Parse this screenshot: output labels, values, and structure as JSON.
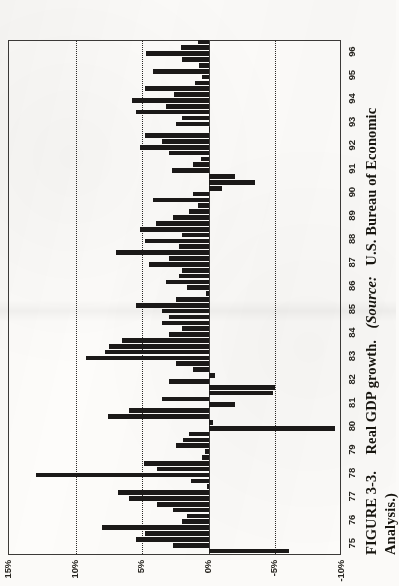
{
  "figure": {
    "caption_label": "FIGURE 3-3.",
    "caption_title": "Real GDP growth.",
    "caption_source_open": "(Source:",
    "caption_source": "U.S. Bureau of Economic",
    "caption_source_cont": "Analysis.)",
    "orientation": "page rotated 90 degrees (landscape figure on portrait scan)"
  },
  "colors": {
    "bar": "#1b1918",
    "frame": "#3c3a38",
    "grid": "#2d2b29",
    "paper": "#fbfaf8"
  },
  "chart_data": {
    "type": "bar",
    "title": "Real GDP growth",
    "xlabel": "",
    "ylabel": "",
    "orientation": "vertical-bars-in-printed-figure",
    "grid": true,
    "legend": false,
    "ylim": [
      -10,
      15
    ],
    "yticks": [
      15,
      10,
      5,
      0,
      -5,
      -10
    ],
    "ytick_labels": [
      "15%",
      "10%",
      "5%",
      "0%",
      "-5%",
      "-10%"
    ],
    "gridline_values": [
      10,
      5,
      -5
    ],
    "zero_line_value": 0,
    "categories": [
      "75",
      "76",
      "77",
      "78",
      "79",
      "80",
      "81",
      "82",
      "83",
      "84",
      "85",
      "86",
      "87",
      "88",
      "89",
      "90",
      "91",
      "92",
      "93",
      "94",
      "95",
      "96"
    ],
    "xtick_labels": [
      "75",
      "76",
      "77",
      "78",
      "79",
      "80",
      "81",
      "82",
      "83",
      "84",
      "85",
      "86",
      "87",
      "88",
      "89",
      "90",
      "91",
      "92",
      "93",
      "94",
      "95",
      "96"
    ],
    "frequency": "quarterly",
    "series": [
      {
        "name": "Real GDP growth (quarterly, annualized %)",
        "points": [
          {
            "period": "75Q1",
            "value": -6.0
          },
          {
            "period": "75Q2",
            "value": 2.7
          },
          {
            "period": "75Q3",
            "value": 5.5
          },
          {
            "period": "75Q4",
            "value": 4.8
          },
          {
            "period": "76Q1",
            "value": 8.0
          },
          {
            "period": "76Q2",
            "value": 2.0
          },
          {
            "period": "76Q3",
            "value": 1.6
          },
          {
            "period": "76Q4",
            "value": 2.7
          },
          {
            "period": "77Q1",
            "value": 3.9
          },
          {
            "period": "77Q2",
            "value": 6.0
          },
          {
            "period": "77Q3",
            "value": 6.8
          },
          {
            "period": "77Q4",
            "value": 0.1
          },
          {
            "period": "78Q1",
            "value": 1.3
          },
          {
            "period": "78Q2",
            "value": 13.0
          },
          {
            "period": "78Q3",
            "value": 3.9
          },
          {
            "period": "78Q4",
            "value": 4.9
          },
          {
            "period": "79Q1",
            "value": 0.5
          },
          {
            "period": "79Q2",
            "value": 0.3
          },
          {
            "period": "79Q3",
            "value": 2.5
          },
          {
            "period": "79Q4",
            "value": 1.9
          },
          {
            "period": "80Q1",
            "value": 1.5
          },
          {
            "period": "80Q2",
            "value": -9.5
          },
          {
            "period": "80Q3",
            "value": -0.3
          },
          {
            "period": "80Q4",
            "value": 7.6
          },
          {
            "period": "81Q1",
            "value": 6.0
          },
          {
            "period": "81Q2",
            "value": -2.0
          },
          {
            "period": "81Q3",
            "value": 3.5
          },
          {
            "period": "81Q4",
            "value": -4.8
          },
          {
            "period": "82Q1",
            "value": -5.0
          },
          {
            "period": "82Q2",
            "value": 3.0
          },
          {
            "period": "82Q3",
            "value": -0.5
          },
          {
            "period": "82Q4",
            "value": 1.2
          },
          {
            "period": "83Q1",
            "value": 2.5
          },
          {
            "period": "83Q2",
            "value": 9.2
          },
          {
            "period": "83Q3",
            "value": 7.8
          },
          {
            "period": "83Q4",
            "value": 7.5
          },
          {
            "period": "84Q1",
            "value": 6.5
          },
          {
            "period": "84Q2",
            "value": 3.0
          },
          {
            "period": "84Q3",
            "value": 2.0
          },
          {
            "period": "84Q4",
            "value": 3.5
          },
          {
            "period": "85Q1",
            "value": 3.0
          },
          {
            "period": "85Q2",
            "value": 3.5
          },
          {
            "period": "85Q3",
            "value": 5.5
          },
          {
            "period": "85Q4",
            "value": 2.5
          },
          {
            "period": "86Q1",
            "value": 0.2
          },
          {
            "period": "86Q2",
            "value": 1.6
          },
          {
            "period": "86Q3",
            "value": 3.2
          },
          {
            "period": "86Q4",
            "value": 2.2
          },
          {
            "period": "87Q1",
            "value": 2.0
          },
          {
            "period": "87Q2",
            "value": 4.5
          },
          {
            "period": "87Q3",
            "value": 3.0
          },
          {
            "period": "87Q4",
            "value": 7.0
          },
          {
            "period": "88Q1",
            "value": 2.2
          },
          {
            "period": "88Q2",
            "value": 4.8
          },
          {
            "period": "88Q3",
            "value": 2.0
          },
          {
            "period": "88Q4",
            "value": 5.2
          },
          {
            "period": "89Q1",
            "value": 4.0
          },
          {
            "period": "89Q2",
            "value": 2.7
          },
          {
            "period": "89Q3",
            "value": 1.5
          },
          {
            "period": "89Q4",
            "value": 0.8
          },
          {
            "period": "90Q1",
            "value": 4.2
          },
          {
            "period": "90Q2",
            "value": 1.2
          },
          {
            "period": "90Q3",
            "value": -1.0
          },
          {
            "period": "90Q4",
            "value": -3.5
          },
          {
            "period": "91Q1",
            "value": -2.0
          },
          {
            "period": "91Q2",
            "value": 2.8
          },
          {
            "period": "91Q3",
            "value": 1.2
          },
          {
            "period": "91Q4",
            "value": 0.6
          },
          {
            "period": "92Q1",
            "value": 3.0
          },
          {
            "period": "92Q2",
            "value": 5.2
          },
          {
            "period": "92Q3",
            "value": 3.5
          },
          {
            "period": "92Q4",
            "value": 4.8
          },
          {
            "period": "93Q1",
            "value": 0.0
          },
          {
            "period": "93Q2",
            "value": 2.5
          },
          {
            "period": "93Q3",
            "value": 2.0
          },
          {
            "period": "93Q4",
            "value": 5.5
          },
          {
            "period": "94Q1",
            "value": 3.2
          },
          {
            "period": "94Q2",
            "value": 5.8
          },
          {
            "period": "94Q3",
            "value": 2.6
          },
          {
            "period": "94Q4",
            "value": 4.8
          },
          {
            "period": "95Q1",
            "value": 1.0
          },
          {
            "period": "95Q2",
            "value": 0.5
          },
          {
            "period": "95Q3",
            "value": 4.2
          },
          {
            "period": "95Q4",
            "value": 0.7
          },
          {
            "period": "96Q1",
            "value": 2.0
          },
          {
            "period": "96Q2",
            "value": 4.7
          },
          {
            "period": "96Q3",
            "value": 2.1
          },
          {
            "period": "96Q4",
            "value": 0.8
          }
        ]
      }
    ]
  }
}
